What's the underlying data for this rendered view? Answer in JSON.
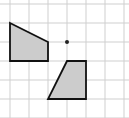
{
  "diagram": {
    "type": "grid-transformation",
    "grid": {
      "origin_px": [
        10,
        4
      ],
      "cell_px": 19,
      "cols": 6,
      "rows": 6,
      "line_color": "#cfcfcf"
    },
    "center_point": {
      "grid": [
        3,
        2
      ],
      "color": "#222222"
    },
    "shapes": [
      {
        "name": "original-shape",
        "points": [
          [
            0,
            1
          ],
          [
            2,
            2
          ],
          [
            2,
            3
          ],
          [
            0,
            3
          ]
        ],
        "fill": "#cccccc",
        "stroke": "#111111"
      },
      {
        "name": "rotated-shape",
        "points": [
          [
            3,
            3
          ],
          [
            4,
            3
          ],
          [
            4,
            5
          ],
          [
            2,
            5
          ]
        ],
        "fill": "#cccccc",
        "stroke": "#111111"
      }
    ]
  }
}
